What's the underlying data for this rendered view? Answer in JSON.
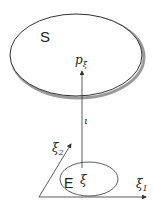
{
  "diagram": {
    "big_set_label": "S",
    "point_label": "p",
    "point_subscript": "ξ",
    "map_label": "ι",
    "small_set_label": "E",
    "small_point_label": "ξ",
    "axis_x_label": "ξ",
    "axis_x_subscript": "1",
    "axis_y_label": "ξ",
    "axis_y_subscript": "2"
  },
  "colors": {
    "stroke": "#333333",
    "shadow": "#9a9a9a",
    "text": "#222222"
  }
}
